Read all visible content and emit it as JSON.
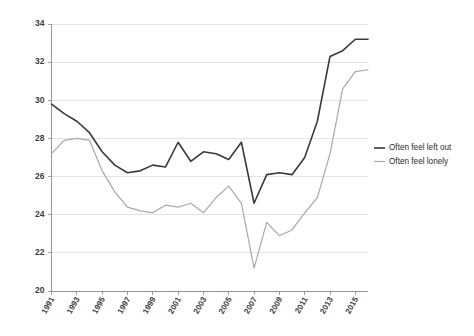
{
  "chart_data": {
    "type": "line",
    "title": "",
    "subtitle": "",
    "xlabel": "",
    "ylabel": "",
    "grid": true,
    "legend_position": "right",
    "ylim": [
      20,
      34
    ],
    "yticks": [
      20,
      22,
      24,
      26,
      28,
      30,
      32,
      34
    ],
    "ytick_labels": [
      "20",
      "22",
      "24",
      "26",
      "28",
      "30",
      "32",
      "34"
    ],
    "x": [
      1991,
      1992,
      1993,
      1994,
      1995,
      1996,
      1997,
      1998,
      1999,
      2000,
      2001,
      2002,
      2003,
      2004,
      2005,
      2006,
      2007,
      2008,
      2009,
      2010,
      2011,
      2012,
      2013,
      2014,
      2015,
      2016
    ],
    "xtick_labels": [
      "1991",
      "1993",
      "1995",
      "1997",
      "1999",
      "2001",
      "2003",
      "2005",
      "2007",
      "2009",
      "2011",
      "2013",
      "2015"
    ],
    "xticks": [
      1991,
      1993,
      1995,
      1997,
      1999,
      2001,
      2003,
      2005,
      2007,
      2009,
      2011,
      2013,
      2015
    ],
    "series": [
      {
        "name": "Often feel left out",
        "color": "#3a3a3a",
        "width": 1.6,
        "values": [
          29.8,
          29.3,
          28.9,
          28.3,
          27.3,
          26.6,
          26.2,
          26.3,
          26.6,
          26.5,
          27.8,
          26.8,
          27.3,
          27.2,
          26.9,
          27.8,
          24.6,
          26.1,
          26.2,
          26.1,
          27.0,
          28.9,
          32.3,
          32.6,
          33.2,
          33.2
        ]
      },
      {
        "name": "Often feel lonely",
        "color": "#a8a8a8",
        "width": 1.2,
        "values": [
          27.2,
          27.9,
          28.0,
          27.9,
          26.3,
          25.2,
          24.4,
          24.2,
          24.1,
          24.5,
          24.4,
          24.6,
          24.1,
          24.9,
          25.5,
          24.6,
          21.2,
          23.6,
          22.9,
          23.2,
          24.1,
          24.9,
          27.2,
          30.6,
          31.5,
          31.6
        ]
      }
    ]
  },
  "legend": {
    "items": [
      {
        "label": "Often feel left out"
      },
      {
        "label": "Often feel lonely"
      }
    ]
  }
}
